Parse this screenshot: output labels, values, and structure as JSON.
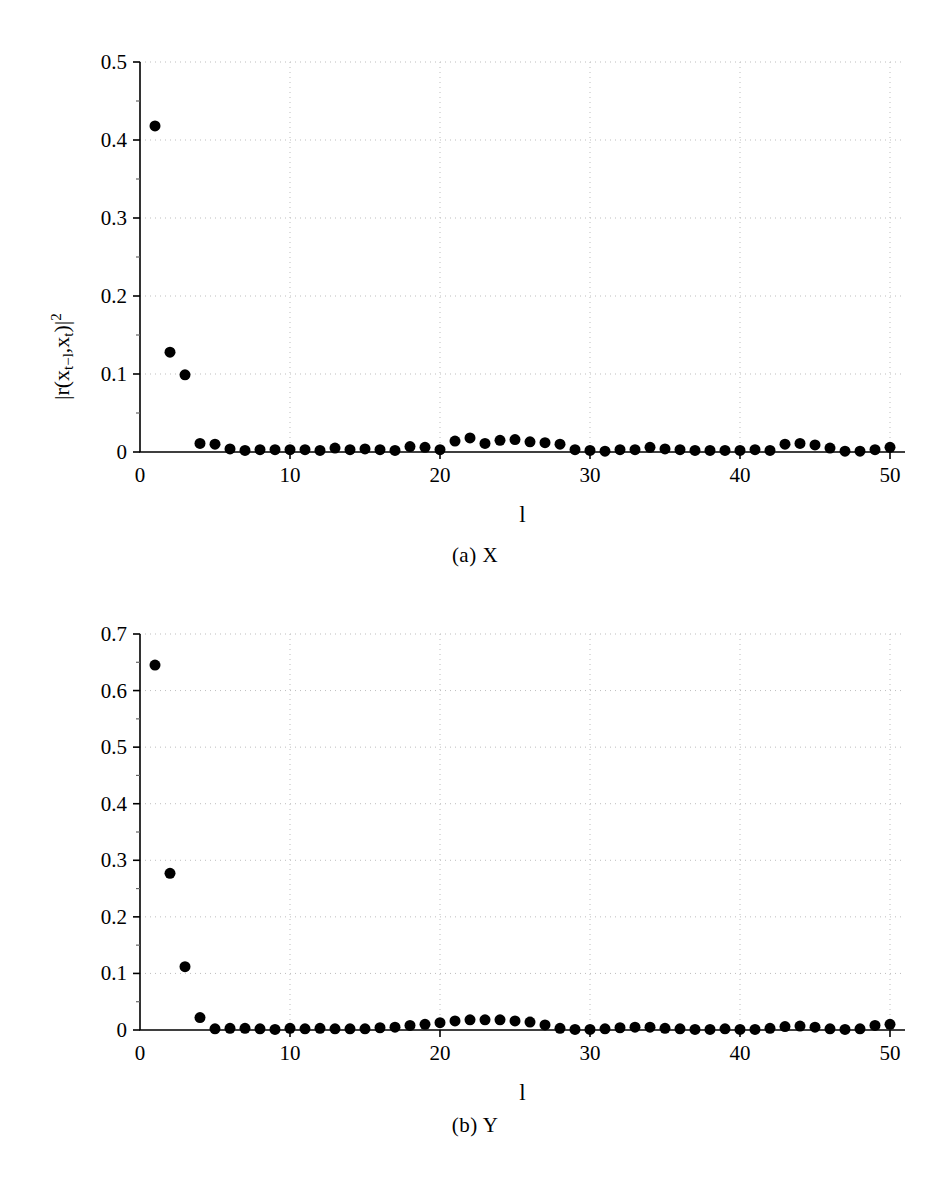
{
  "figure": {
    "panels": [
      {
        "id": "a",
        "caption": "(a) X",
        "chart_key": 0
      },
      {
        "id": "b",
        "caption": "(b) Y",
        "chart_key": 1
      }
    ]
  },
  "chart_data": [
    {
      "type": "scatter",
      "title": "",
      "panel_caption": "(a) X",
      "xlabel": "l",
      "ylabel": "|r(x_{t-l},x_t)|^2",
      "ylabel_parts": {
        "prefix": "|r(x",
        "sub1": "t−l",
        "mid": ",x",
        "sub2": "t",
        "suffix": ")|",
        "sup": "2"
      },
      "xlim": [
        0,
        51
      ],
      "ylim": [
        0,
        0.5
      ],
      "xticks": [
        0,
        10,
        20,
        30,
        40,
        50
      ],
      "xtick_labels": [
        "0",
        "10",
        "20",
        "30",
        "40",
        "50"
      ],
      "yticks": [
        0,
        0.1,
        0.2,
        0.3,
        0.4,
        0.5
      ],
      "ytick_labels": [
        "0",
        "0.1",
        "0.2",
        "0.3",
        "0.4",
        "0.5"
      ],
      "grid": "dotted",
      "grid_color": "#bdbdbd",
      "marker": "filled-circle",
      "marker_color": "#000000",
      "marker_size": 8,
      "legend": "none",
      "x": [
        1,
        2,
        3,
        4,
        5,
        6,
        7,
        8,
        9,
        10,
        11,
        12,
        13,
        14,
        15,
        16,
        17,
        18,
        19,
        20,
        21,
        22,
        23,
        24,
        25,
        26,
        27,
        28,
        29,
        30,
        31,
        32,
        33,
        34,
        35,
        36,
        37,
        38,
        39,
        40,
        41,
        42,
        43,
        44,
        45,
        46,
        47,
        48,
        49,
        50
      ],
      "y": [
        0.418,
        0.128,
        0.099,
        0.011,
        0.01,
        0.004,
        0.002,
        0.003,
        0.003,
        0.003,
        0.003,
        0.002,
        0.005,
        0.003,
        0.004,
        0.003,
        0.002,
        0.007,
        0.006,
        0.003,
        0.014,
        0.018,
        0.011,
        0.015,
        0.016,
        0.013,
        0.012,
        0.01,
        0.003,
        0.002,
        0.001,
        0.003,
        0.003,
        0.006,
        0.004,
        0.003,
        0.002,
        0.002,
        0.002,
        0.002,
        0.003,
        0.002,
        0.01,
        0.011,
        0.009,
        0.005,
        0.001,
        0.001,
        0.003,
        0.006
      ]
    },
    {
      "type": "scatter",
      "title": "",
      "panel_caption": "(b) Y",
      "xlabel": "l",
      "ylabel": "|r(y_{t-l},y_t)|^2",
      "ylabel_parts": {
        "prefix": "|r(y",
        "sub1": "t−l",
        "mid": ",y",
        "sub2": "t",
        "suffix": ")|",
        "sup": "2"
      },
      "xlim": [
        0,
        51
      ],
      "ylim": [
        0,
        0.7
      ],
      "xticks": [
        0,
        10,
        20,
        30,
        40,
        50
      ],
      "xtick_labels": [
        "0",
        "10",
        "20",
        "30",
        "40",
        "50"
      ],
      "yticks": [
        0,
        0.1,
        0.2,
        0.3,
        0.4,
        0.5,
        0.6,
        0.7
      ],
      "ytick_labels": [
        "0",
        "0.1",
        "0.2",
        "0.3",
        "0.4",
        "0.5",
        "0.6",
        "0.7"
      ],
      "grid": "dotted",
      "grid_color": "#bdbdbd",
      "marker": "filled-circle",
      "marker_color": "#000000",
      "marker_size": 8,
      "legend": "none",
      "x": [
        1,
        2,
        3,
        4,
        5,
        6,
        7,
        8,
        9,
        10,
        11,
        12,
        13,
        14,
        15,
        16,
        17,
        18,
        19,
        20,
        21,
        22,
        23,
        24,
        25,
        26,
        27,
        28,
        29,
        30,
        31,
        32,
        33,
        34,
        35,
        36,
        37,
        38,
        39,
        40,
        41,
        42,
        43,
        44,
        45,
        46,
        47,
        48,
        49,
        50
      ],
      "y": [
        0.645,
        0.277,
        0.112,
        0.022,
        0.002,
        0.003,
        0.003,
        0.002,
        0.001,
        0.003,
        0.002,
        0.003,
        0.002,
        0.002,
        0.002,
        0.004,
        0.005,
        0.008,
        0.01,
        0.013,
        0.016,
        0.018,
        0.018,
        0.018,
        0.016,
        0.014,
        0.009,
        0.003,
        0.001,
        0.001,
        0.002,
        0.004,
        0.005,
        0.005,
        0.003,
        0.002,
        0.001,
        0.001,
        0.002,
        0.001,
        0.001,
        0.003,
        0.006,
        0.007,
        0.005,
        0.002,
        0.001,
        0.002,
        0.008,
        0.01
      ]
    }
  ]
}
